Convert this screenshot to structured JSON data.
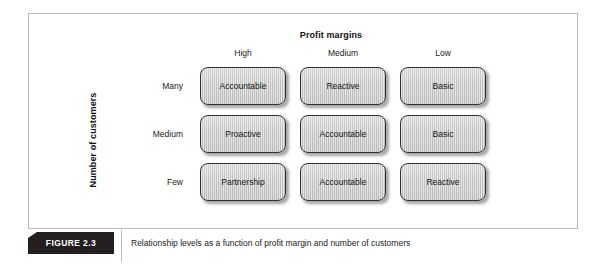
{
  "figure": {
    "tag": "FIGURE 2.3",
    "caption": "Relationship levels as a function of profit margin and number of customers"
  },
  "chart_data": {
    "type": "table",
    "title": "Relationship levels as a function of profit margin and number of customers",
    "xlabel": "Profit margins",
    "ylabel": "Number of customers",
    "categories": [
      "High",
      "Medium",
      "Low"
    ],
    "rows": [
      "Many",
      "Medium",
      "Few"
    ],
    "cells": [
      [
        "Accountable",
        "Reactive",
        "Basic"
      ],
      [
        "Proactive",
        "Accountable",
        "Basic"
      ],
      [
        "Partnership",
        "Accountable",
        "Reactive"
      ]
    ]
  },
  "matrix": {
    "col_axis_title": "Profit margins",
    "row_axis_title": "Number of customers",
    "columns": [
      {
        "label": "High"
      },
      {
        "label": "Medium"
      },
      {
        "label": "Low"
      }
    ],
    "rows": [
      {
        "label": "Many",
        "cells": [
          {
            "label": "Accountable"
          },
          {
            "label": "Reactive"
          },
          {
            "label": "Basic"
          }
        ]
      },
      {
        "label": "Medium",
        "cells": [
          {
            "label": "Proactive"
          },
          {
            "label": "Accountable"
          },
          {
            "label": "Basic"
          }
        ]
      },
      {
        "label": "Few",
        "cells": [
          {
            "label": "Partnership"
          },
          {
            "label": "Accountable"
          },
          {
            "label": "Reactive"
          }
        ]
      }
    ]
  },
  "colors": {
    "frame_border": "#b9b9b9",
    "banner_background": "#231f20",
    "banner_text": "#ffffff",
    "box_fill": "#cccccc",
    "box_border": "#2e2e2e",
    "text": "#1a1a1a"
  }
}
